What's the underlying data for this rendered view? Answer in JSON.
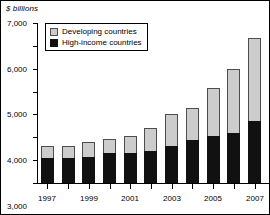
{
  "chart_data": {
    "type": "bar",
    "title": "$ billions",
    "subtitle": "",
    "xlabel": "",
    "ylabel": "$ billions",
    "stacked": true,
    "grid": false,
    "legend_position": "top-left",
    "categories": [
      "1997",
      "1998",
      "1999",
      "2000",
      "2001",
      "2002",
      "2003",
      "2004",
      "2005",
      "2006",
      "2007"
    ],
    "tick_labels_shown": [
      "1997",
      "1999",
      "2001",
      "2003",
      "2005",
      "2007"
    ],
    "ylim": [
      0,
      7000
    ],
    "yticks": [
      0,
      1000,
      2000,
      3000,
      4000,
      5000,
      6000,
      7000
    ],
    "ytick_labels": [
      "0",
      "1,000",
      "2,000",
      "3,000",
      "4,000",
      "5,000",
      "6,000",
      "7,000"
    ],
    "series": [
      {
        "name": "High-income countries",
        "color": "#111111",
        "values": [
          1080,
          1090,
          1150,
          1300,
          1320,
          1400,
          1600,
          1900,
          2050,
          2200,
          2700
        ]
      },
      {
        "name": "Developing countries",
        "color": "#cccccc",
        "values": [
          560,
          550,
          630,
          630,
          720,
          1000,
          1400,
          1400,
          2100,
          2800,
          3650
        ]
      }
    ],
    "totals": [
      1640,
      1640,
      1780,
      1930,
      2040,
      2400,
      3000,
      3300,
      4150,
      5000,
      6350
    ]
  },
  "legend": {
    "items": [
      {
        "label": "Developing countries",
        "key": "developing"
      },
      {
        "label": "High-income countries",
        "key": "highincome"
      }
    ]
  }
}
